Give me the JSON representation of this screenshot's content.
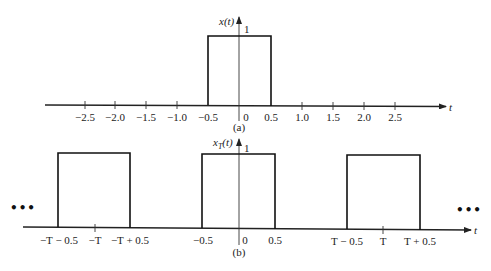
{
  "figure_a": {
    "ylabel": "x(t)",
    "xlabel": "t",
    "amplitude_label": "1",
    "caption": "(a)",
    "ticks": [
      "−2.5",
      "−2.0",
      "−1.5",
      "−1.0",
      "−0.5",
      "0",
      "0.5",
      "1.0",
      "1.5",
      "2.0",
      "2.5"
    ],
    "pulse": {
      "start": -0.5,
      "end": 0.5,
      "height": 1
    }
  },
  "figure_b": {
    "ylabel": "x",
    "ylabel_sub": "T",
    "ylabel_arg": "(t)",
    "xlabel": "t",
    "amplitude_label": "1",
    "caption": "(b)",
    "ticks": [
      "−T − 0.5",
      "−T",
      "−T + 0.5",
      "−0.5",
      "0",
      "0.5",
      "T − 0.5",
      "T",
      "T + 0.5"
    ],
    "ellipsis_left": "•••",
    "ellipsis_right": "•••",
    "pulses": [
      {
        "start": "−T − 0.5",
        "end": "−T + 0.5",
        "height": 1
      },
      {
        "start": "−0.5",
        "end": "0.5",
        "height": 1
      },
      {
        "start": "T − 0.5",
        "end": "T + 0.5",
        "height": 1
      }
    ]
  }
}
